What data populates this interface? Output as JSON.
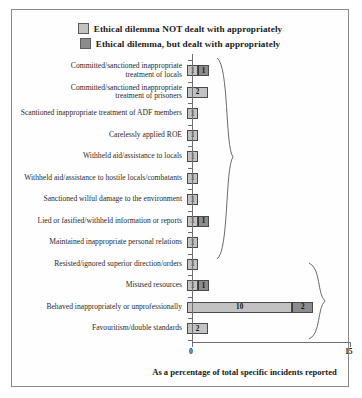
{
  "legend": {
    "items": [
      {
        "label": "Ethical dilemma NOT dealt with appropriately",
        "color": "#c2c2c2",
        "name": "legend-swatch-not-dealt"
      },
      {
        "label": "Ethical dilemma, but dealt with appropriately",
        "color": "#8c8c8c",
        "name": "legend-swatch-dealt"
      }
    ]
  },
  "axis": {
    "x_title": "As a percentage of total specific incidents reported",
    "ticks": [
      "0",
      "15"
    ],
    "min": 0,
    "max": 15
  },
  "chart_data": {
    "type": "bar",
    "orientation": "horizontal",
    "stacked": true,
    "title": "",
    "xlabel": "As a percentage of total specific incidents reported",
    "ylabel": "",
    "xlim": [
      0,
      15
    ],
    "xticks": [
      0,
      15
    ],
    "grid": false,
    "legend_position": "top-center",
    "series": [
      {
        "name": "Ethical dilemma NOT dealt with appropriately",
        "color": "#c2c2c2",
        "values": [
          1,
          2,
          1,
          1,
          1,
          1,
          1,
          1,
          1,
          1,
          1,
          10,
          2
        ]
      },
      {
        "name": "Ethical dilemma, but dealt with appropriately",
        "color": "#8c8c8c",
        "values": [
          1,
          0,
          0,
          0,
          0,
          0,
          0,
          1,
          0,
          0,
          1,
          2,
          0
        ]
      }
    ],
    "categories": [
      "Committed/sanctioned inappropriate\ntreatment of locals",
      "Committed/sanctioned inappropriate\ntreatment of prisoners",
      "Scantioned inappropriate treatment of ADF members",
      "Carelessly applied ROE",
      "Withheld aid/assistance to locals",
      "Withheld aid/assistance to hostile locals/combatants",
      "Sanctioned wilful damage to the environment",
      "Lied or fasified/withheld information or reports",
      "Maintained inappropriate personal relations",
      "Resisted/ignored superior direction/orders",
      "Misused resources",
      "Behaved inappropriately or unprofessionally",
      "Favouritism/double standards"
    ],
    "bar_labels": [
      [
        "1",
        "1"
      ],
      [
        "2",
        ""
      ],
      [
        "1",
        ""
      ],
      [
        "1",
        ""
      ],
      [
        "1",
        ""
      ],
      [
        "1",
        ""
      ],
      [
        "1",
        ""
      ],
      [
        "1",
        "1"
      ],
      [
        "1",
        ""
      ],
      [
        "1",
        ""
      ],
      [
        "1",
        "1"
      ],
      [
        "10",
        "2"
      ],
      [
        "2",
        ""
      ]
    ],
    "annotations": [
      {
        "type": "brace",
        "name": "brace-upper-group",
        "rows": [
          0,
          9
        ]
      },
      {
        "type": "brace",
        "name": "brace-lower-group",
        "rows": [
          10,
          12
        ]
      }
    ]
  }
}
